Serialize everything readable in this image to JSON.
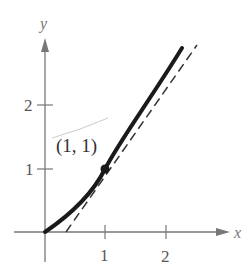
{
  "figure": {
    "axes": {
      "x_label": "x",
      "y_label": "y",
      "x_ticks": [
        {
          "value": 1,
          "label": "1"
        },
        {
          "value": 2,
          "label": "2"
        }
      ],
      "y_ticks": [
        {
          "value": 1,
          "label": "1"
        },
        {
          "value": 2,
          "label": "2"
        }
      ]
    },
    "point": {
      "x": 1,
      "y": 1,
      "label": "(1, 1)"
    },
    "curve": {
      "style": "solid-thick",
      "color": "#1a1a1a",
      "description": "increasing curve through origin and (1, 1)"
    },
    "tangent": {
      "style": "dashed",
      "color": "#333333",
      "description": "tangent line at (1, 1)"
    }
  }
}
